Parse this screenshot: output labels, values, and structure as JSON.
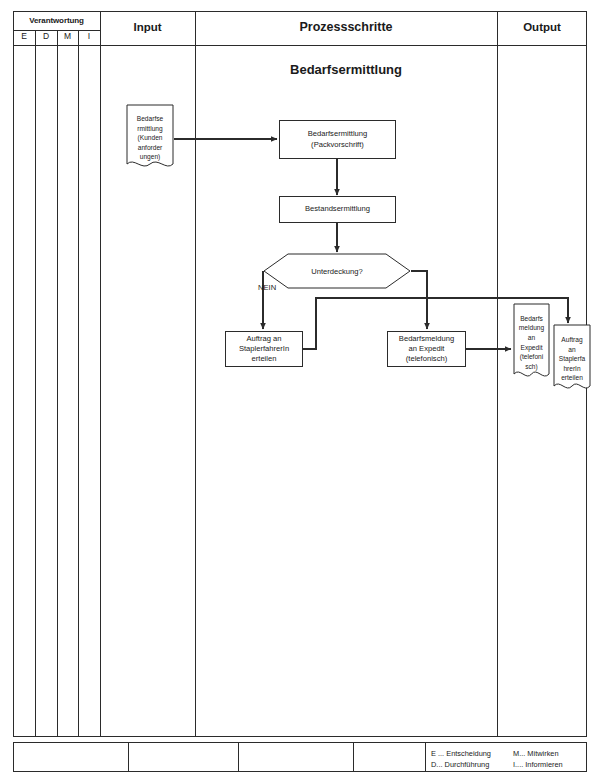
{
  "document": {
    "title": "Bedarfsermittlung"
  },
  "header": {
    "responsibility_group": "Verantwortung",
    "responsibility_columns": [
      {
        "key": "E",
        "label": "E"
      },
      {
        "key": "D",
        "label": "D"
      },
      {
        "key": "M",
        "label": "M"
      },
      {
        "key": "I",
        "label": "I"
      }
    ],
    "columns": [
      {
        "key": "input",
        "label": "Input"
      },
      {
        "key": "process",
        "label": "Prozessschritte"
      },
      {
        "key": "output",
        "label": "Output"
      }
    ]
  },
  "diagram": {
    "title": "Bedarfsermittlung",
    "input_documents": [
      {
        "id": "in-bedarfsermittlung",
        "text": "Bedarfsermittlung (Kundenanforderungen)",
        "lines": [
          "Bedarfse",
          "rmittlung",
          "(Kunden",
          "anforder",
          "ungen)"
        ]
      }
    ],
    "process_steps": [
      {
        "id": "proc-bedarfsermittlung",
        "text": "Bedarfsermittlung (Packvorschrift)",
        "lines": [
          "Bedarfsermittlung",
          "(Packvorschrift)"
        ]
      },
      {
        "id": "proc-bestandsermittlung",
        "text": "Bestandsermittlung",
        "lines": [
          "Bestandsermittlung"
        ]
      },
      {
        "id": "proc-auftrag-stapler",
        "text": "Auftrag an StaplerfahrerIn erteilen",
        "lines": [
          "Auftrag an",
          "StaplerfahrerIn",
          "erteilen"
        ]
      },
      {
        "id": "proc-bedarfsmeldung",
        "text": "Bedarfsmeldung an Expedit (telefonisch)",
        "lines": [
          "Bedarfsmeldung",
          "an Expedit",
          "(telefonisch)"
        ]
      }
    ],
    "decisions": [
      {
        "id": "dec-unterdeckung",
        "text": "Unterdeckung?",
        "branches": [
          {
            "label": "NEIN",
            "direction": "left"
          }
        ]
      }
    ],
    "output_documents": [
      {
        "id": "out-bedarfsmeldung",
        "text": "Bedarfsmeldung an Expedit (telefonisch)",
        "lines": [
          "Bedarfs",
          "meldung",
          "an",
          "Expedit",
          "(telefoni",
          "sch)"
        ]
      },
      {
        "id": "out-auftrag-stapler",
        "text": "Auftrag an StaplerfahrerIn erteilen",
        "lines": [
          "Auftrag",
          "an",
          "Staplerfa",
          "hrerIn",
          "erteilen"
        ]
      }
    ]
  },
  "legend": {
    "left_column": [
      {
        "abbr": "E",
        "text": "E ... Entscheidung"
      },
      {
        "abbr": "D",
        "text": "D... Durchführung"
      }
    ],
    "right_column": [
      {
        "abbr": "M",
        "text": "M... Mitwirken"
      },
      {
        "abbr": "I",
        "text": "I.... Informieren"
      }
    ]
  },
  "colors": {
    "line": "#2b2b2b",
    "text": "#1a1a1a",
    "background": "#ffffff"
  }
}
